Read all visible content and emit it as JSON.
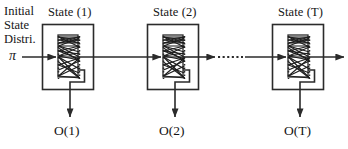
{
  "figure": {
    "name": "hidden-markov-model-trellis-chain",
    "background_color": "#ffffff",
    "line_color": "#2b2b2b",
    "text_color": "#151515"
  },
  "initial_distribution": {
    "line1": "Initial",
    "line2": "State",
    "line3": "Distri.",
    "symbol": "π"
  },
  "stages": [
    {
      "title": "State (1)",
      "output_label": "O(1)",
      "box_x": 42,
      "box_y": 24,
      "box_w": 51,
      "box_h": 66,
      "title_x": 48,
      "title_y": 7,
      "output_x": 54,
      "output_y": 125
    },
    {
      "title": "State (2)",
      "output_label": "O(2)",
      "box_x": 147,
      "box_y": 24,
      "box_w": 51,
      "box_h": 66,
      "title_x": 152,
      "title_y": 7,
      "output_x": 159,
      "output_y": 125
    },
    {
      "title": "State (T)",
      "output_label": "O(T)",
      "box_x": 272,
      "box_y": 24,
      "box_w": 51,
      "box_h": 66,
      "title_x": 277,
      "title_y": 7,
      "output_x": 284,
      "output_y": 125
    }
  ],
  "connectors": {
    "ellipsis_dots": 8,
    "chain_y": 57
  }
}
